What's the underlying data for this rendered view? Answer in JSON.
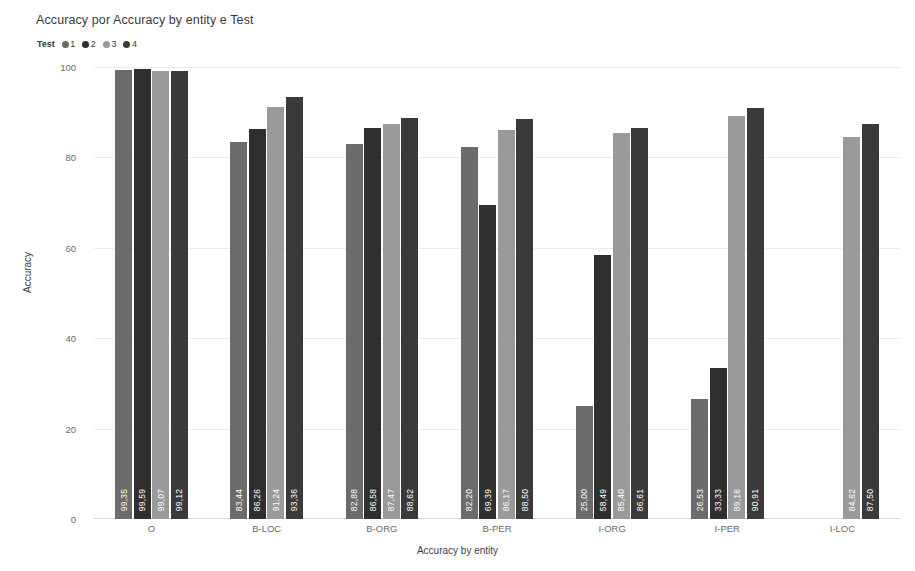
{
  "chart_title": "Accuracy por Accuracy by entity e Test",
  "legend": {
    "title": "Test",
    "items": [
      {
        "label": "1",
        "color": "#6b6b6b"
      },
      {
        "label": "2",
        "color": "#2f2f2f"
      },
      {
        "label": "3",
        "color": "#9a9a9a"
      },
      {
        "label": "4",
        "color": "#3a3a3a"
      }
    ]
  },
  "chart_data": {
    "type": "bar",
    "title": "Accuracy por Accuracy by entity e Test",
    "xlabel": "Accuracy by entity",
    "ylabel": "Accuracy",
    "ylim": [
      0,
      100
    ],
    "yticks": [
      0,
      20,
      40,
      60,
      80,
      100
    ],
    "grid": true,
    "legend_position": "top-left",
    "legend_title": "Test",
    "categories": [
      "O",
      "B-LOC",
      "B-ORG",
      "B-PER",
      "I-ORG",
      "I-PER",
      "I-LOC"
    ],
    "series": [
      {
        "name": "1",
        "color": "#6b6b6b",
        "values": [
          99.35,
          83.44,
          82.88,
          82.2,
          25.0,
          26.53,
          null
        ],
        "labels": [
          "99,35",
          "83,44",
          "82,88",
          "82,20",
          "25,00",
          "26,53",
          null
        ]
      },
      {
        "name": "2",
        "color": "#2f2f2f",
        "values": [
          99.59,
          86.26,
          86.58,
          69.39,
          58.49,
          33.33,
          null
        ],
        "labels": [
          "99,59",
          "86,26",
          "86,58",
          "69,39",
          "58,49",
          "33,33",
          null
        ]
      },
      {
        "name": "3",
        "color": "#9a9a9a",
        "values": [
          99.07,
          91.24,
          87.47,
          86.17,
          85.4,
          89.16,
          84.62
        ],
        "labels": [
          "99,07",
          "91,24",
          "87,47",
          "86,17",
          "85,40",
          "89,16",
          "84,62"
        ]
      },
      {
        "name": "4",
        "color": "#3a3a3a",
        "values": [
          99.12,
          93.36,
          88.62,
          88.5,
          86.61,
          90.91,
          87.5
        ],
        "labels": [
          "99,12",
          "93,36",
          "88,62",
          "88,50",
          "86,61",
          "90,91",
          "87,50"
        ]
      }
    ]
  }
}
